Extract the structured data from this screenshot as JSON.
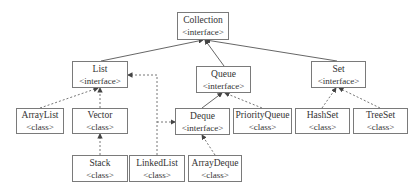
{
  "diagram": {
    "nodes": {
      "collection": {
        "name": "Collection",
        "kind": "<interface>"
      },
      "list": {
        "name": "List",
        "kind": "<interface>"
      },
      "queue": {
        "name": "Queue",
        "kind": "<interface>"
      },
      "set": {
        "name": "Set",
        "kind": "<interface>"
      },
      "arraylist": {
        "name": "ArrayList",
        "kind": "<class>"
      },
      "vector": {
        "name": "Vector",
        "kind": "<class>"
      },
      "deque": {
        "name": "Deque",
        "kind": "<interface>"
      },
      "priorityqueue": {
        "name": "PriorityQueue",
        "kind": "<class>"
      },
      "hashset": {
        "name": "HashSet",
        "kind": "<class>"
      },
      "treeset": {
        "name": "TreeSet",
        "kind": "<class>"
      },
      "stack": {
        "name": "Stack",
        "kind": "<class>"
      },
      "linkedlist": {
        "name": "LinkedList",
        "kind": "<class>"
      },
      "arraydeque": {
        "name": "ArrayDeque",
        "kind": "<class>"
      }
    },
    "edges": [
      {
        "from": "List",
        "to": "Collection",
        "style": "solid",
        "relation": "extends"
      },
      {
        "from": "Queue",
        "to": "Collection",
        "style": "solid",
        "relation": "extends"
      },
      {
        "from": "Set",
        "to": "Collection",
        "style": "solid",
        "relation": "extends"
      },
      {
        "from": "ArrayList",
        "to": "List",
        "style": "dashed",
        "relation": "implements"
      },
      {
        "from": "Vector",
        "to": "List",
        "style": "dashed",
        "relation": "implements"
      },
      {
        "from": "Stack",
        "to": "Vector",
        "style": "dashed",
        "relation": "extends"
      },
      {
        "from": "LinkedList",
        "to": "List",
        "style": "dashed",
        "relation": "implements"
      },
      {
        "from": "LinkedList",
        "to": "Deque",
        "style": "dashed",
        "relation": "implements"
      },
      {
        "from": "Deque",
        "to": "Queue",
        "style": "solid",
        "relation": "extends"
      },
      {
        "from": "PriorityQueue",
        "to": "Queue",
        "style": "dashed",
        "relation": "implements"
      },
      {
        "from": "ArrayDeque",
        "to": "Deque",
        "style": "dashed",
        "relation": "implements"
      },
      {
        "from": "HashSet",
        "to": "Set",
        "style": "dashed",
        "relation": "implements"
      },
      {
        "from": "TreeSet",
        "to": "Set",
        "style": "dashed",
        "relation": "implements"
      }
    ],
    "colors": {
      "border": "#7a7a7a",
      "line": "#555555",
      "text": "#333333"
    }
  }
}
